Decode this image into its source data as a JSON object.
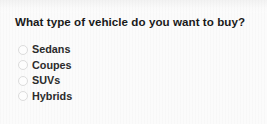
{
  "survey": {
    "title": "What type of vehicle do you want to buy?",
    "input_type": "radio",
    "selected": null,
    "options": [
      {
        "label": "Sedans",
        "icon": "radio-unchecked-icon",
        "checked": false
      },
      {
        "label": "Coupes",
        "icon": "radio-unchecked-icon",
        "checked": false
      },
      {
        "label": "SUVs",
        "icon": "radio-unchecked-icon",
        "checked": false
      },
      {
        "label": "Hybrids",
        "icon": "radio-unchecked-icon",
        "checked": false
      }
    ]
  },
  "colors": {
    "background": "#fbfbfb",
    "title_text": "#1a1a1a",
    "option_text": "#2b2b2b",
    "radio_border": "#dcdcdc",
    "radio_fill": "#fdfdfd"
  }
}
